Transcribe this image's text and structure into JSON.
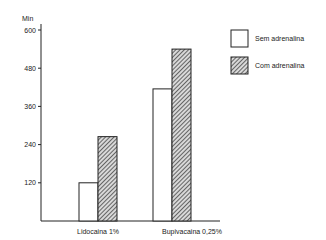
{
  "chart_data": {
    "type": "bar",
    "title": "",
    "xlabel": "",
    "ylabel": "Min",
    "ylim": [
      0,
      600
    ],
    "yticks": [
      120,
      240,
      360,
      480,
      600
    ],
    "grid": false,
    "legend_position": "upper right",
    "categories": [
      "Lidocaina 1%",
      "Bupivacaina 0,25%"
    ],
    "series": [
      {
        "name": "Sem adrenalina",
        "pattern": "solid-white",
        "values": [
          120,
          415
        ]
      },
      {
        "name": "Com adrenalina",
        "pattern": "diagonal-hatch",
        "values": [
          265,
          540
        ]
      }
    ]
  },
  "colors": {
    "axis": "#222222",
    "bar_fill_plain": "#ffffff",
    "hatch": "#333333"
  }
}
